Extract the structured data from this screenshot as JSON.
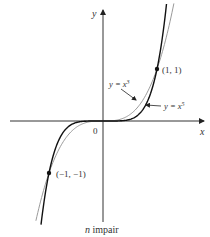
{
  "figure": {
    "axis_x_label": "x",
    "axis_y_label": "y",
    "origin_label": "0",
    "caption_var": "n",
    "caption_text": " impair",
    "point_pos": "(1, 1)",
    "point_neg": "(−1, −1)",
    "curve_cubic_label": {
      "prefix": "y = x",
      "exp": "3"
    },
    "curve_quintic_label": {
      "prefix": "y = x",
      "exp": "5"
    },
    "colors": {
      "axis": "#333333",
      "cubic": "#9a9a9a",
      "quintic": "#111111"
    }
  },
  "chart_data": {
    "type": "line",
    "title": "",
    "caption": "n impair",
    "xlabel": "x",
    "ylabel": "y",
    "series": [
      {
        "name": "y = x^3",
        "function": "x^3",
        "style": "thin gray"
      },
      {
        "name": "y = x^5",
        "function": "x^5",
        "style": "black"
      }
    ],
    "marked_points": [
      [
        1,
        1
      ],
      [
        -1,
        -1
      ]
    ],
    "xlim": [
      -1.7,
      1.9
    ],
    "ylim": [
      -1.95,
      2.15
    ],
    "grid": false,
    "legend": "inline annotations with arrows"
  }
}
